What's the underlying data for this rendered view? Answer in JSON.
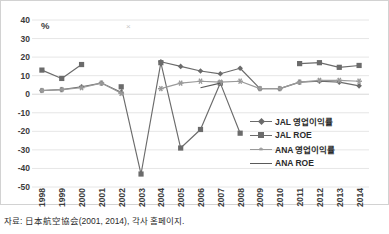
{
  "unit_label": "%",
  "stray_marker": "×",
  "source_note": "자료: 日本航空協会(2001, 2014), 각사 홈페이지.",
  "legend": {
    "position": "inside-right",
    "items": [
      {
        "label": "JAL 영업이익률",
        "color": "#6b6b6b",
        "marker": "diamond"
      },
      {
        "label": "JAL ROE",
        "color": "#6b6b6b",
        "marker": "square"
      },
      {
        "label": "ANA 영업이익률",
        "color": "#9a9a9a",
        "marker": "star"
      },
      {
        "label": "ANA ROE",
        "color": "#5a5a5a",
        "marker": "none"
      }
    ]
  },
  "chart_data": {
    "type": "line",
    "title": "",
    "subtitle": "",
    "xlabel": "",
    "ylabel": "%",
    "ylim": [
      -50,
      40
    ],
    "ytick_step": 10,
    "yticks": [
      40,
      30,
      20,
      10,
      0,
      -10,
      -20,
      -30,
      -40,
      -50
    ],
    "grid": true,
    "grid_axis": "y",
    "legend_position": "inside-right",
    "categories": [
      "1998",
      "1999",
      "2000",
      "2001",
      "2002",
      "2003",
      "2004",
      "2005",
      "2006",
      "2007",
      "2008",
      "2009",
      "2010",
      "2011",
      "2012",
      "2013",
      "2014"
    ],
    "series": [
      {
        "name": "JAL 영업이익률",
        "color": "#6b6b6b",
        "marker": "diamond",
        "values": [
          2,
          2.5,
          4,
          6,
          1,
          null,
          17.5,
          15,
          12.5,
          11,
          14,
          3,
          3,
          6.5,
          7,
          6.5,
          4.5
        ]
      },
      {
        "name": "JAL ROE",
        "color": "#6b6b6b",
        "marker": "square",
        "values": [
          13,
          8.5,
          16,
          null,
          4,
          -43,
          17,
          -29,
          -19,
          6,
          -21,
          null,
          null,
          16.5,
          17,
          14.5,
          15.5
        ]
      },
      {
        "name": "ANA 영업이익률",
        "color": "#9a9a9a",
        "marker": "star",
        "values": [
          2,
          2.5,
          3.5,
          6,
          0.5,
          null,
          3,
          6,
          7,
          6.5,
          7,
          3,
          3,
          6.5,
          7.5,
          7.5,
          7
        ]
      },
      {
        "name": "ANA ROE",
        "color": "#5a5a5a",
        "marker": "none",
        "values": [
          null,
          null,
          null,
          null,
          null,
          null,
          null,
          null,
          3.5,
          6,
          null,
          null,
          null,
          null,
          null,
          null,
          null
        ]
      }
    ]
  }
}
